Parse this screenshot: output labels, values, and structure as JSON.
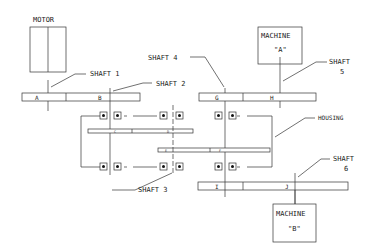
{
  "diagram": {
    "components": {
      "motor": {
        "label": "MOTOR"
      },
      "machine_a": {
        "label": "MACHINE",
        "sub": "\"A\""
      },
      "machine_b": {
        "label": "MACHINE",
        "sub": "\"B\""
      },
      "housing": {
        "label": "HOUSING"
      }
    },
    "shafts": [
      {
        "id": 1,
        "label": "SHAFT 1"
      },
      {
        "id": 2,
        "label": "SHAFT 2"
      },
      {
        "id": 3,
        "label": "SHAFT 3"
      },
      {
        "id": 4,
        "label": "SHAFT 4"
      },
      {
        "id": 5,
        "label": "SHAFT",
        "num": "5"
      },
      {
        "id": 6,
        "label": "SHAFT",
        "num": "6"
      }
    ],
    "gears": [
      "A",
      "B",
      "C",
      "D",
      "E",
      "F",
      "G",
      "H",
      "I",
      "J"
    ]
  }
}
